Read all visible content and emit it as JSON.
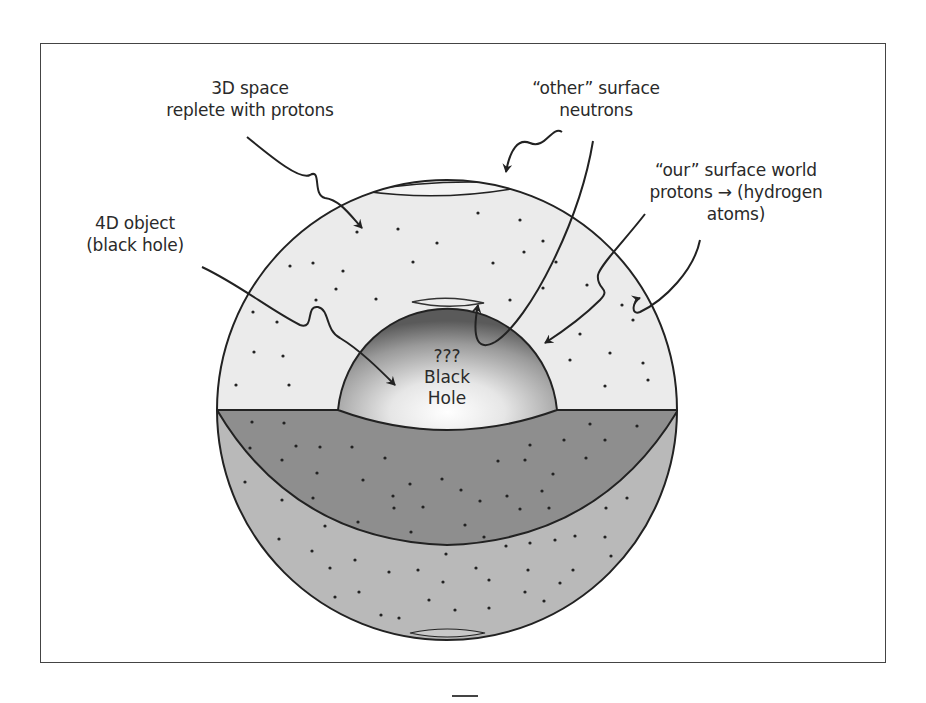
{
  "figure": {
    "type": "diagram",
    "labels": {
      "space_3d": {
        "line1": "3D space",
        "line2": "replete with protons"
      },
      "other_surface": {
        "line1": "“other” surface",
        "line2": "neutrons"
      },
      "our_surface": {
        "line1": "“our” surface world",
        "line2": "protons → (hydrogen",
        "line3": "atoms)"
      },
      "object_4d": {
        "line1": "4D object",
        "line2": "(black hole)"
      },
      "black_hole": {
        "line1": "???",
        "line2": "Black",
        "line3": "Hole"
      }
    },
    "colors": {
      "frame": "#444444",
      "upper_hemisphere": "#ebebeb",
      "dark_band": "#8e8e8e",
      "lower_shell": "#b9b9b9",
      "outline": "#222222"
    }
  },
  "page": {
    "footer_mark": "—"
  }
}
